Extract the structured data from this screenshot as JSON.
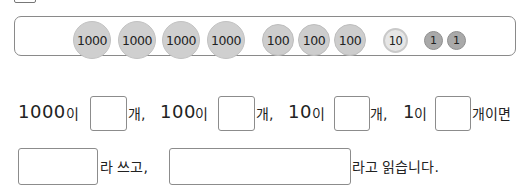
{
  "coins": {
    "thousands": [
      "1000",
      "1000",
      "1000",
      "1000"
    ],
    "hundreds": [
      "100",
      "100",
      "100"
    ],
    "tens": [
      "10"
    ],
    "ones": [
      "1",
      "1"
    ]
  },
  "sentence1": {
    "n1000": "1000",
    "i1": "이",
    "gae1": "개,",
    "n100": "100",
    "i2": "이",
    "gae2": "개,",
    "n10": "10",
    "i3": "이",
    "gae3": "개,",
    "n1": "1",
    "i4": "이",
    "gae_imyeon": "개이면"
  },
  "sentence2": {
    "ra_sseugo": "라 쓰고,",
    "ra_go_ilksseumnida": "라고 읽습니다."
  },
  "answers": {
    "count_1000": "",
    "count_100": "",
    "count_10": "",
    "count_1": "",
    "written": "",
    "read": ""
  },
  "colors": {
    "coin_1000": "#cfcfcf",
    "coin_100": "#cdcdcd",
    "coin_10": "#e6e6e6",
    "coin_1": "#a9a9a9",
    "border": "#8a8a8a"
  }
}
